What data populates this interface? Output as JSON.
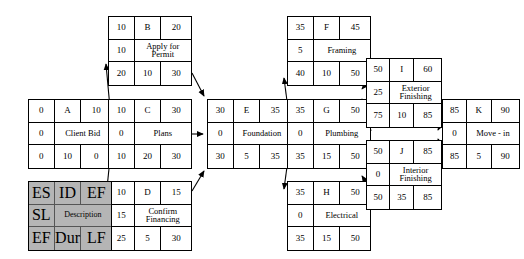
{
  "diagram": {
    "type": "activity-on-node-network",
    "legend": {
      "name": "node-key-legend",
      "es": "ES",
      "id": "ID",
      "ef_top": "EF",
      "sl": "SL",
      "description": "Description",
      "ef_bottom": "EF",
      "dur": "Dur",
      "lf": "LF"
    },
    "nodes": [
      {
        "key": "A",
        "id": "A",
        "description": "Client Bid",
        "es": "0",
        "ef_top": "10",
        "sl": "0",
        "ef_bottom": "0",
        "dur": "10",
        "lf": "0",
        "x": 28,
        "y": 99,
        "w": 84,
        "h": 70
      },
      {
        "key": "B",
        "id": "B",
        "description": "Apply for Permit",
        "es": "10",
        "ef_top": "20",
        "sl": "10",
        "ef_bottom": "20",
        "dur": "10",
        "lf": "30",
        "x": 108,
        "y": 16,
        "w": 84,
        "h": 70
      },
      {
        "key": "C",
        "id": "C",
        "description": "Plans",
        "es": "10",
        "ef_top": "30",
        "sl": "0",
        "ef_bottom": "10",
        "dur": "20",
        "lf": "30",
        "x": 108,
        "y": 99,
        "w": 84,
        "h": 70
      },
      {
        "key": "D",
        "id": "D",
        "description": "Confirm Financing",
        "es": "10",
        "ef_top": "15",
        "sl": "15",
        "ef_bottom": "25",
        "dur": "5",
        "lf": "30",
        "x": 108,
        "y": 181,
        "w": 84,
        "h": 70
      },
      {
        "key": "E",
        "id": "E",
        "description": "Foundation",
        "es": "30",
        "ef_top": "35",
        "sl": "0",
        "ef_bottom": "30",
        "dur": "5",
        "lf": "35",
        "x": 207,
        "y": 99,
        "w": 84,
        "h": 70
      },
      {
        "key": "F",
        "id": "F",
        "description": "Framing",
        "es": "35",
        "ef_top": "45",
        "sl": "5",
        "ef_bottom": "40",
        "dur": "10",
        "lf": "50",
        "x": 287,
        "y": 16,
        "w": 84,
        "h": 70
      },
      {
        "key": "G",
        "id": "G",
        "description": "Plumbing",
        "es": "35",
        "ef_top": "50",
        "sl": "0",
        "ef_bottom": "35",
        "dur": "15",
        "lf": "50",
        "x": 287,
        "y": 99,
        "w": 84,
        "h": 70
      },
      {
        "key": "H",
        "id": "H",
        "description": "Electrical",
        "es": "35",
        "ef_top": "50",
        "sl": "0",
        "ef_bottom": "35",
        "dur": "15",
        "lf": "50",
        "x": 287,
        "y": 181,
        "w": 84,
        "h": 70
      },
      {
        "key": "I",
        "id": "I",
        "description": "Exterior Finishing",
        "es": "50",
        "ef_top": "60",
        "sl": "25",
        "ef_bottom": "75",
        "dur": "10",
        "lf": "85",
        "x": 366,
        "y": 58,
        "w": 76,
        "h": 70
      },
      {
        "key": "J",
        "id": "J",
        "description": "Interior Finishing",
        "es": "50",
        "ef_top": "85",
        "sl": "0",
        "ef_bottom": "50",
        "dur": "35",
        "lf": "85",
        "x": 366,
        "y": 140,
        "w": 76,
        "h": 70
      },
      {
        "key": "K",
        "id": "K",
        "description": "Move - in",
        "es": "85",
        "ef_top": "90",
        "sl": "0",
        "ef_bottom": "85",
        "dur": "5",
        "lf": "90",
        "x": 442,
        "y": 99,
        "w": 78,
        "h": 70
      }
    ],
    "edges": [
      {
        "from": "A",
        "to": "B"
      },
      {
        "from": "A",
        "to": "C"
      },
      {
        "from": "A",
        "to": "D"
      },
      {
        "from": "B",
        "to": "E"
      },
      {
        "from": "C",
        "to": "E"
      },
      {
        "from": "D",
        "to": "E"
      },
      {
        "from": "E",
        "to": "F"
      },
      {
        "from": "E",
        "to": "G"
      },
      {
        "from": "E",
        "to": "H"
      },
      {
        "from": "F",
        "to": "I"
      },
      {
        "from": "G",
        "to": "I"
      },
      {
        "from": "G",
        "to": "J"
      },
      {
        "from": "H",
        "to": "J"
      },
      {
        "from": "I",
        "to": "K"
      },
      {
        "from": "J",
        "to": "K"
      }
    ]
  }
}
